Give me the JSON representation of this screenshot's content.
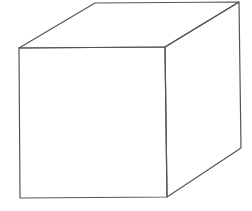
{
  "figure": {
    "faces_visible": [
      "front",
      "top",
      "right"
    ],
    "line_color": "#555555",
    "background_color": "#ffffff"
  }
}
